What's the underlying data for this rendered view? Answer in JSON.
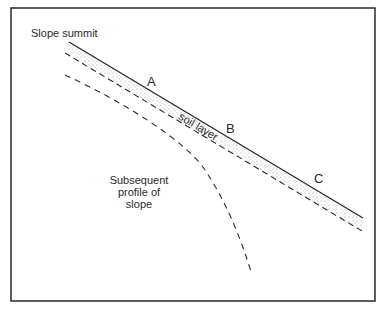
{
  "diagram": {
    "type": "geomorphology cross-section",
    "labels": {
      "summit": "Slope summit",
      "point_a": "A",
      "point_b": "B",
      "point_c": "C",
      "soil_layer": "soil layer",
      "subsequent_profile": [
        "Subsequent",
        "profile of",
        "slope"
      ]
    },
    "elements": [
      {
        "id": "ground-surface",
        "style": "solid line",
        "meaning": "current slope surface"
      },
      {
        "id": "soil-layer",
        "style": "stippled band",
        "meaning": "soil layer"
      },
      {
        "id": "soil-base",
        "style": "dashed line",
        "meaning": "base of soil layer"
      },
      {
        "id": "subsequent-profile",
        "style": "dashed curve",
        "meaning": "subsequent profile of slope"
      }
    ],
    "colors": {
      "line": "#2a2a2a",
      "stipple": "#9a9a9a",
      "background": "#ffffff"
    }
  }
}
